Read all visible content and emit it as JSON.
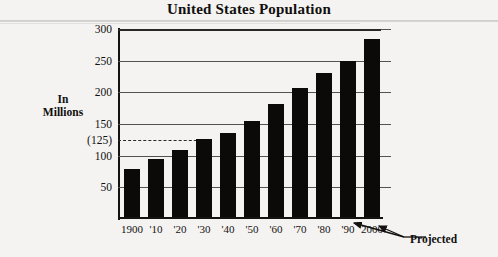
{
  "chart_data": {
    "type": "bar",
    "title": "United States Population",
    "xlabel": "",
    "ylabel": "In Millions",
    "ylabel_lines": [
      "In",
      "Millions"
    ],
    "categories": [
      "1900",
      "'10",
      "'20",
      "'30",
      "'40",
      "'50",
      "'60",
      "'70",
      "'80",
      "'90",
      "2000"
    ],
    "values": [
      76,
      92,
      106,
      123,
      132,
      151,
      179,
      203,
      227,
      247,
      281
    ],
    "ylim": [
      0,
      300
    ],
    "yticks": [
      50,
      100,
      125,
      150,
      200,
      250,
      300
    ],
    "ytick_labels": [
      "50",
      "100",
      "(125)",
      "150",
      "200",
      "250",
      "300"
    ],
    "gridlines": [
      50,
      100,
      150,
      200,
      250,
      300
    ],
    "dashed_reference": {
      "value": 125,
      "label": "(125)",
      "extends_to_category": "'30"
    },
    "grid": true,
    "legend": "none",
    "bar_color": "#0b0a09",
    "annotations": [
      {
        "text": "Projected",
        "points_to": [
          "'90",
          "2000"
        ]
      }
    ]
  },
  "chart": {
    "title": "United States Population",
    "axis_label_line1": "In",
    "axis_label_line2": "Millions",
    "projected_label": "Projected"
  }
}
